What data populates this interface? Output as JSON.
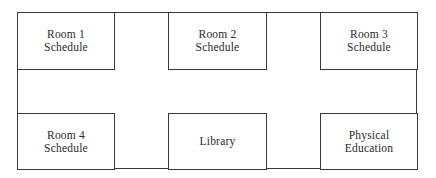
{
  "diagram": {
    "type": "floor-plan",
    "rooms": [
      {
        "label": "Room 1\nSchedule",
        "position": "top-left"
      },
      {
        "label": "Room 2\nSchedule",
        "position": "top-center"
      },
      {
        "label": "Room 3\nSchedule",
        "position": "top-right"
      },
      {
        "label": "Room 4\nSchedule",
        "position": "bottom-left"
      },
      {
        "label": "Library",
        "position": "bottom-center"
      },
      {
        "label": "Physical\nEducation",
        "position": "bottom-right"
      }
    ],
    "colors": {
      "stroke": "#3a3a3a",
      "text": "#2a2a2a",
      "background": "#ffffff"
    }
  }
}
